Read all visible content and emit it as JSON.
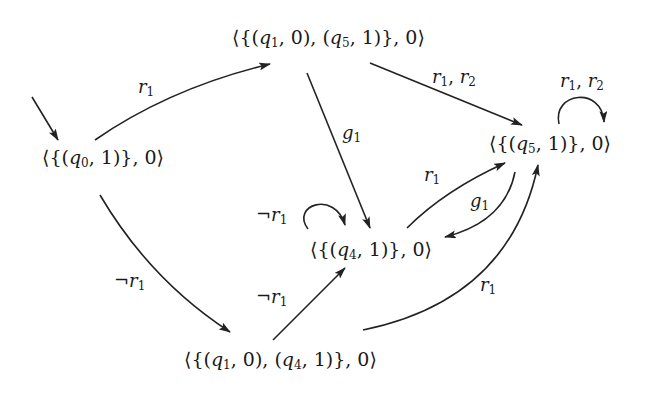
{
  "diagram": {
    "type": "state-transition-graph",
    "stroke_color": "#222222",
    "text_color": "#1a1a1a",
    "background": "#ffffff",
    "nodes": [
      {
        "id": "A",
        "label": "⟨{(q0, 1)}, 0⟩",
        "initial": true
      },
      {
        "id": "B",
        "label": "⟨{(q1, 0), (q5, 1)}, 0⟩"
      },
      {
        "id": "C",
        "label": "⟨{(q5, 1)}, 0⟩"
      },
      {
        "id": "D",
        "label": "⟨{(q4, 1)}, 0⟩"
      },
      {
        "id": "E",
        "label": "⟨{(q1, 0), (q4, 1)}, 0⟩"
      }
    ],
    "edges": [
      {
        "from": "A",
        "to": "B",
        "label": "r1"
      },
      {
        "from": "A",
        "to": "E",
        "label": "¬r1"
      },
      {
        "from": "B",
        "to": "D",
        "label": "g1"
      },
      {
        "from": "B",
        "to": "C",
        "label": "r1, r2"
      },
      {
        "from": "C",
        "to": "C",
        "label": "r1, r2"
      },
      {
        "from": "D",
        "to": "C",
        "label": "r1"
      },
      {
        "from": "C",
        "to": "D",
        "label": "g1"
      },
      {
        "from": "D",
        "to": "D",
        "label": "¬r1"
      },
      {
        "from": "E",
        "to": "D",
        "label": "¬r1"
      },
      {
        "from": "E",
        "to": "C",
        "label": "r1"
      }
    ]
  },
  "labels": {
    "nodeA": {
      "open": "⟨{(",
      "var": "q",
      "sub": "0",
      "rest": ", 1)}, 0⟩"
    },
    "nodeB": {
      "open": "⟨{(",
      "var1": "q",
      "sub1": "1",
      "mid": ", 0), (",
      "var2": "q",
      "sub2": "5",
      "rest": ", 1)}, 0⟩"
    },
    "nodeC": {
      "open": "⟨{(",
      "var": "q",
      "sub": "5",
      "rest": ", 1)}, 0⟩"
    },
    "nodeD": {
      "open": "⟨{(",
      "var": "q",
      "sub": "4",
      "rest": ", 1)}, 0⟩"
    },
    "nodeE": {
      "open": "⟨{(",
      "var1": "q",
      "sub1": "1",
      "mid": ", 0), (",
      "var2": "q",
      "sub2": "4",
      "rest": ", 1)}, 0⟩"
    },
    "edge_AB": {
      "base": "r",
      "sub": "1"
    },
    "edge_AE": {
      "neg": "¬",
      "base": "r",
      "sub": "1"
    },
    "edge_BD": {
      "base": "g",
      "sub": "1"
    },
    "edge_BC": {
      "base1": "r",
      "sub1": "1",
      "sep": ", ",
      "base2": "r",
      "sub2": "2"
    },
    "edge_CC": {
      "base1": "r",
      "sub1": "1",
      "sep": ", ",
      "base2": "r",
      "sub2": "2"
    },
    "edge_DC": {
      "base": "r",
      "sub": "1"
    },
    "edge_CD": {
      "base": "g",
      "sub": "1"
    },
    "edge_DD": {
      "neg": "¬",
      "base": "r",
      "sub": "1"
    },
    "edge_ED": {
      "neg": "¬",
      "base": "r",
      "sub": "1"
    },
    "edge_EC": {
      "base": "r",
      "sub": "1"
    }
  }
}
